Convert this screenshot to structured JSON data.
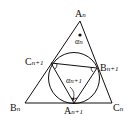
{
  "diagram": {
    "type": "geometry",
    "labels": {
      "A_n": {
        "main": "A",
        "sub": "n"
      },
      "B_n": {
        "main": "B",
        "sub": "n"
      },
      "C_n": {
        "main": "C",
        "sub": "n"
      },
      "A_n1": {
        "main": "A",
        "sub": "n+1"
      },
      "B_n1": {
        "main": "B",
        "sub": "n+1"
      },
      "C_n1": {
        "main": "C",
        "sub": "n+1"
      },
      "alpha_n": {
        "main": "α",
        "sub": "n"
      },
      "alpha_n1": {
        "main": "α",
        "sub": "n+1"
      }
    },
    "colors": {
      "stroke": "#111111",
      "background": "#ffffff"
    }
  }
}
